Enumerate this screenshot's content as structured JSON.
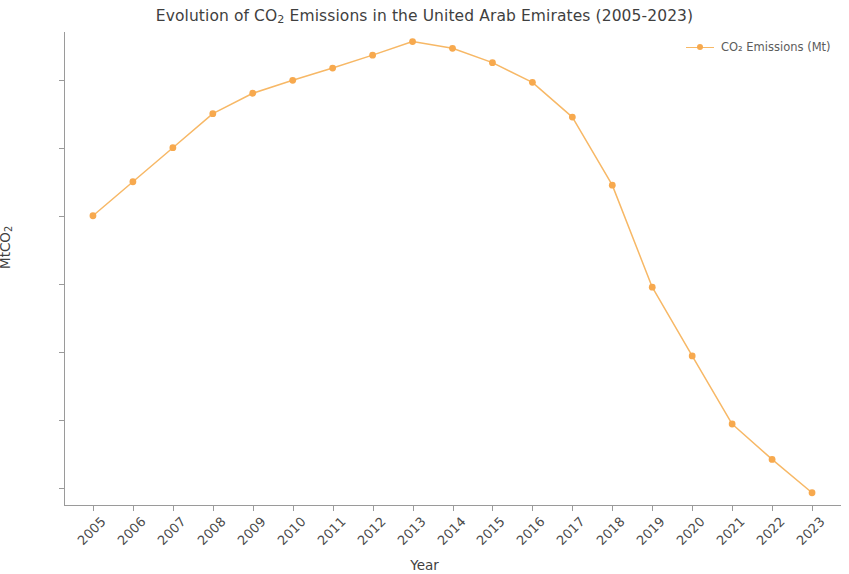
{
  "chart_data": {
    "type": "line",
    "xlabel": "Year",
    "ylabel": "MtCO₂",
    "categories": [
      "2005",
      "2006",
      "2007",
      "2008",
      "2009",
      "2010",
      "2011",
      "2012",
      "2013",
      "2014",
      "2015",
      "2016",
      "2017",
      "2018",
      "2019",
      "2020",
      "2021",
      "2022",
      "2023"
    ],
    "x": [
      2005,
      2006,
      2007,
      2008,
      2009,
      2010,
      2011,
      2012,
      2013,
      2014,
      2015,
      2016,
      2017,
      2018,
      2019,
      2020,
      2021,
      2022,
      2023
    ],
    "series": [
      {
        "name": "CO₂ Emissions (Mt)",
        "color": "#f7b866",
        "marker_color": "#f7a94e",
        "values": [
          160.0,
          165.0,
          170.0,
          175.0,
          178.0,
          179.9,
          181.7,
          183.6,
          185.6,
          184.6,
          182.5,
          179.6,
          174.5,
          164.5,
          149.5,
          139.4,
          129.4,
          124.2,
          119.3
        ]
      }
    ],
    "ylim": [
      117.5,
      187.0
    ],
    "xlim": [
      2004.3,
      2023.7
    ],
    "yticks": [
      120,
      130,
      140,
      150,
      160,
      170,
      180
    ],
    "ytick_labels": [
      "120",
      "130",
      "140",
      "150",
      "160",
      "170",
      "180"
    ],
    "xtick_labels": [
      "2005",
      "2006",
      "2007",
      "2008",
      "2009",
      "2010",
      "2011",
      "2012",
      "2013",
      "2014",
      "2015",
      "2016",
      "2017",
      "2018",
      "2019",
      "2020",
      "2021",
      "2022",
      "2023"
    ],
    "grid": false,
    "legend_position": "top-right",
    "legend_entries": [
      "CO₂ Emissions (Mt)"
    ],
    "marker": "circle",
    "annotations": []
  },
  "legend": {
    "entry_label": "CO₂ Emissions (Mt)"
  },
  "axes": {
    "x_title": "Year",
    "y_title": "MtCO₂"
  }
}
